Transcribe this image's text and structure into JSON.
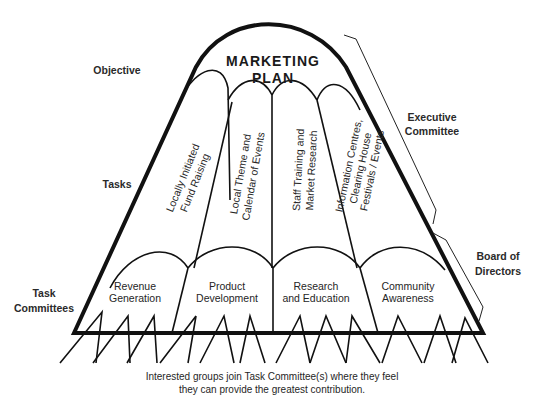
{
  "diagram": {
    "title_line1": "MARKETING",
    "title_line2": "PLAN",
    "side_labels": {
      "objective": "Objective",
      "tasks": "Tasks",
      "task_committees_line1": "Task",
      "task_committees_line2": "Committees",
      "executive_line1": "Executive",
      "executive_line2": "Committee",
      "board_line1": "Board of",
      "board_line2": "Directors"
    },
    "tasks": [
      {
        "line1": "Locally Initiated",
        "line2": "Fund Raising",
        "line3": ""
      },
      {
        "line1": "Local Theme and",
        "line2": "Calendar of Events",
        "line3": ""
      },
      {
        "line1": "Staff Training and",
        "line2": "Market Research",
        "line3": ""
      },
      {
        "line1": "Information Centres,",
        "line2": "Clearing House",
        "line3": "Festivals / Events"
      }
    ],
    "committees": [
      {
        "line1": "Revenue",
        "line2": "Generation"
      },
      {
        "line1": "Product",
        "line2": "Development"
      },
      {
        "line1": "Research",
        "line2": "and Education"
      },
      {
        "line1": "Community",
        "line2": "Awareness"
      }
    ],
    "caption_line1": "Interested groups join Task Committee(s) where they feel",
    "caption_line2": "they can provide the greatest contribution.",
    "colors": {
      "ink": "#111111",
      "background": "#ffffff"
    }
  }
}
